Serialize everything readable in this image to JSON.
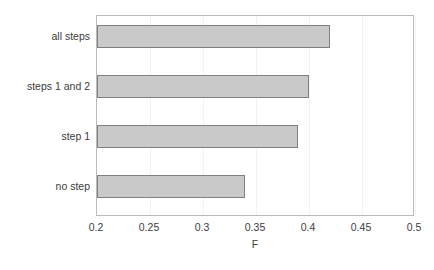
{
  "chart_data": {
    "type": "bar",
    "orientation": "horizontal",
    "title": "",
    "xlabel": "F",
    "ylabel": "",
    "categories": [
      "no step",
      "step 1",
      "steps 1 and 2",
      "all steps"
    ],
    "values": [
      0.34,
      0.39,
      0.4,
      0.42
    ],
    "xlim": [
      0.2,
      0.5
    ],
    "xticks": [
      0.2,
      0.25,
      0.3,
      0.35,
      0.4,
      0.45,
      0.5
    ],
    "xtick_labels": [
      "0.2",
      "0.25",
      "0.3",
      "0.35",
      "0.4",
      "0.45",
      "0.5"
    ],
    "grid": true,
    "grid_axis": "x",
    "legend": null,
    "bar_fill_color": "#c9c9c9",
    "bar_border_color": "#808080",
    "plot_border_color": "#b9b9b9",
    "gridline_color": "#f2f2f2",
    "text_color": "#3b3b3b",
    "background_color": "#ffffff"
  },
  "axis": {
    "x_title": "F"
  },
  "caption": {
    "clipped_text": ""
  }
}
